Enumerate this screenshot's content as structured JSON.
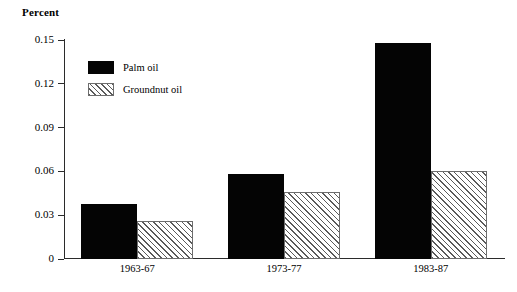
{
  "chart_data": {
    "type": "bar",
    "title": "",
    "ylabel": "Percent",
    "xlabel": "",
    "categories": [
      "1963-67",
      "1973-77",
      "1983-87"
    ],
    "series": [
      {
        "name": "Palm oil",
        "values": [
          0.038,
          0.058,
          0.148
        ],
        "color": "#040404",
        "fill": "solid"
      },
      {
        "name": "Groundnut oil",
        "values": [
          0.026,
          0.046,
          0.06
        ],
        "color": "#5a5a5a",
        "fill": "diagonal-hatch"
      }
    ],
    "ylim": [
      0,
      0.15
    ],
    "yticks": [
      0,
      0.03,
      0.06,
      0.09,
      0.12,
      0.15
    ],
    "ytick_labels": [
      "0",
      "0.03",
      "0.06",
      "0.09",
      "0.12",
      "0.15"
    ],
    "grid": false,
    "legend_position": "upper-left-inside"
  },
  "legend": {
    "items": [
      {
        "label": "Palm oil"
      },
      {
        "label": "Groundnut oil"
      }
    ]
  }
}
